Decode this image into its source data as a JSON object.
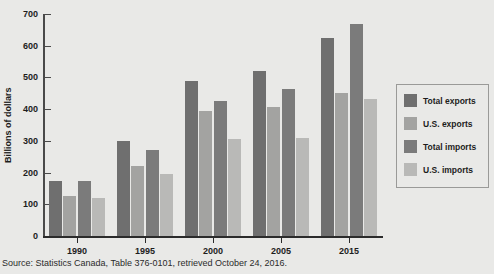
{
  "chart_data": {
    "type": "bar",
    "title": "",
    "xlabel": "",
    "ylabel": "Billions of dollars",
    "ylim": [
      0,
      700
    ],
    "yticks": [
      0,
      100,
      200,
      300,
      400,
      500,
      600,
      700
    ],
    "grid": false,
    "legend_position": "right",
    "categories": [
      "1990",
      "1995",
      "2000",
      "2005",
      "2015"
    ],
    "series": [
      {
        "name": "Total exports",
        "color": "#6f6f6f",
        "values": [
          175,
          300,
          489,
          520,
          625
        ]
      },
      {
        "name": "U.S. exports",
        "color": "#a3a3a1",
        "values": [
          125,
          222,
          393,
          408,
          452
        ]
      },
      {
        "name": "Total imports",
        "color": "#7b7b7b",
        "values": [
          175,
          272,
          425,
          463,
          670
        ]
      },
      {
        "name": "U.S. imports",
        "color": "#b9b9b7",
        "values": [
          120,
          197,
          305,
          308,
          432
        ]
      }
    ]
  },
  "legend": {
    "items": [
      {
        "label": "Total exports",
        "color": "#6f6f6f"
      },
      {
        "label": "U.S. exports",
        "color": "#a3a3a1"
      },
      {
        "label": "Total imports",
        "color": "#7b7b7b"
      },
      {
        "label": "U.S. imports",
        "color": "#b9b9b7"
      }
    ]
  },
  "source": {
    "text": "Source: Statistics Canada, Table 376-0101, retrieved October 24, 2016."
  }
}
